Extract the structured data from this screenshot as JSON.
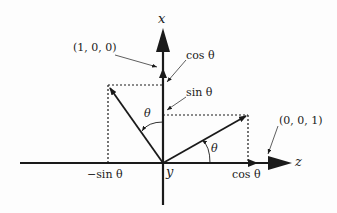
{
  "axes": {
    "x_label": "x",
    "y_label": "y",
    "z_label": "z"
  },
  "points": {
    "x_unit": "(1, 0, 0)",
    "z_unit": "(0, 0, 1)"
  },
  "annotations": {
    "cos_x": "cos θ",
    "sin_x": "sin θ",
    "neg_sin_z": "−sin θ",
    "cos_z": "cos θ",
    "theta_left": "θ",
    "theta_right": "θ"
  },
  "colors": {
    "ink": "#1a1a1a",
    "background": "#fdfdfd"
  }
}
